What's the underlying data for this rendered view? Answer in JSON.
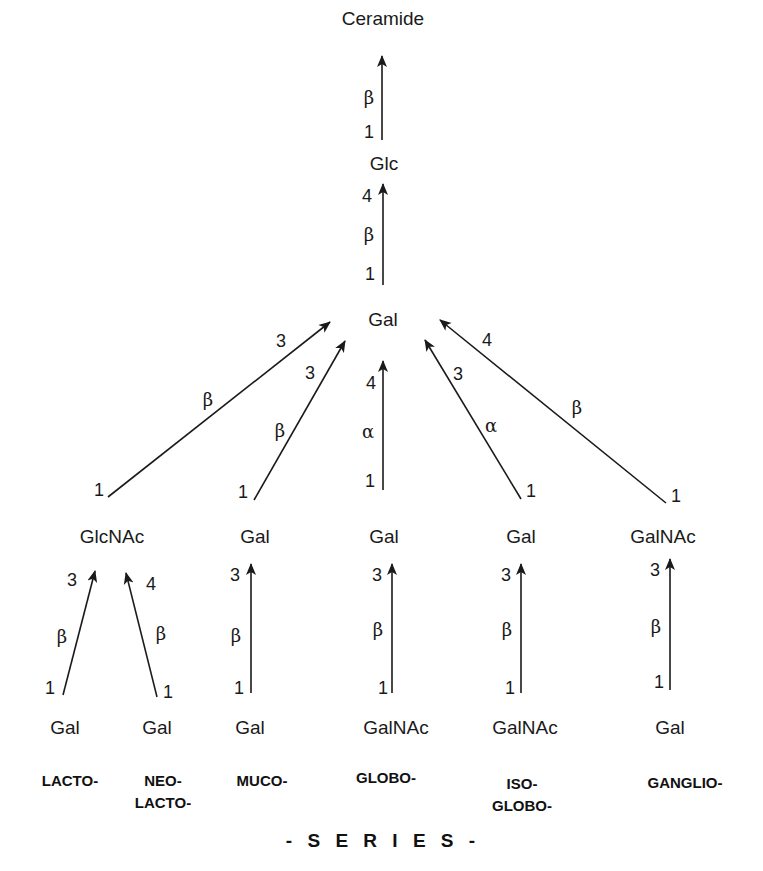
{
  "nodes": {
    "ceramide": "Ceramide",
    "glc": "Glc",
    "gal_core": "Gal",
    "row2": {
      "lacto_glcnac": "GlcNAc",
      "muco_gal": "Gal",
      "globo_gal": "Gal",
      "isoglobo_gal": "Gal",
      "ganglio_galnac": "GalNAc"
    },
    "row3": {
      "lacto_gal": "Gal",
      "neolacto_gal": "Gal",
      "muco_gal": "Gal",
      "globo_galnac": "GalNAc",
      "isoglobo_galnac": "GalNAc",
      "ganglio_gal": "Gal"
    }
  },
  "linkages": {
    "glc_to_ceramide": {
      "anomer": "β",
      "from": "1",
      "to": ""
    },
    "gal_to_glc": {
      "anomer": "β",
      "from": "1",
      "to": "4"
    },
    "glcnac_to_gal": {
      "anomer": "β",
      "from": "1",
      "to": "3"
    },
    "muco_gal_to_gal": {
      "anomer": "β",
      "from": "1",
      "to": "3"
    },
    "globo_gal_to_gal": {
      "anomer": "α",
      "from": "1",
      "to": "4"
    },
    "isoglobo_gal_to_gal": {
      "anomer": "α",
      "from": "1",
      "to": "3"
    },
    "ganglio_galnac_to_gal": {
      "anomer": "β",
      "from": "1",
      "to": "4"
    },
    "lacto_gal_to_glcnac": {
      "anomer": "β",
      "from": "1",
      "to": "3"
    },
    "neolacto_gal_to_glcnac": {
      "anomer": "β",
      "from": "1",
      "to": "4"
    },
    "muco_gal_to_gal_row2": {
      "anomer": "β",
      "from": "1",
      "to": "3"
    },
    "globo_galnac_to_gal": {
      "anomer": "β",
      "from": "1",
      "to": "3"
    },
    "isoglobo_galnac_to_gal": {
      "anomer": "β",
      "from": "1",
      "to": "3"
    },
    "ganglio_gal_to_galnac": {
      "anomer": "β",
      "from": "1",
      "to": "3"
    }
  },
  "series": {
    "lacto": [
      "LACTO-"
    ],
    "neolacto": [
      "NEO-",
      "LACTO-"
    ],
    "muco": [
      "MUCO-"
    ],
    "globo": [
      "GLOBO-"
    ],
    "isoglobo": [
      "ISO-",
      "GLOBO-"
    ],
    "ganglio": [
      "GANGLIO-"
    ],
    "title": "- S E R I E S -"
  },
  "colors": {
    "ink": "#1a1a1a",
    "background": "#ffffff"
  }
}
